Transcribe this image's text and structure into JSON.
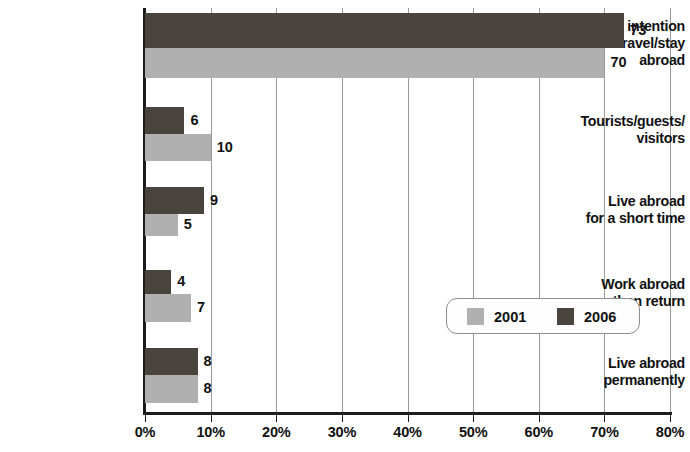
{
  "chart_data": {
    "type": "bar",
    "orientation": "horizontal",
    "title": "",
    "xlabel": "",
    "ylabel": "",
    "xlim": [
      0,
      80
    ],
    "grid": true,
    "legend_position": "inside-right",
    "xtick_labels": [
      "0%",
      "10%",
      "20%",
      "30%",
      "40%",
      "50%",
      "60%",
      "70%",
      "80%"
    ],
    "xtick_values": [
      0,
      10,
      20,
      30,
      40,
      50,
      60,
      70,
      80
    ],
    "categories": [
      "No intention\nto travel/stay\nabroad",
      "Tourists/guests/\nvisitors",
      "Live abroad\nfor a short time",
      "Work abroad\nthen return",
      "Live abroad\npermanently"
    ],
    "series": [
      {
        "name": "2006",
        "color": "#4a443f",
        "values": [
          73,
          6,
          9,
          4,
          8
        ]
      },
      {
        "name": "2001",
        "color": "#b0b0b0",
        "values": [
          70,
          10,
          5,
          7,
          8
        ]
      }
    ]
  },
  "legend": {
    "entries": [
      {
        "label": "2001",
        "swatch": "legend-swatch-2001"
      },
      {
        "label": "2006",
        "swatch": "legend-swatch-2006"
      }
    ]
  },
  "axis": {
    "line_color": "#1c1c1c",
    "grid_color": "#9a9a9a"
  }
}
